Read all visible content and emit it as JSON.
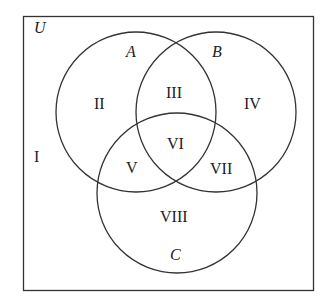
{
  "diagram": {
    "type": "venn-3-set",
    "universe_label": "U",
    "sets": [
      {
        "label": "A"
      },
      {
        "label": "B"
      },
      {
        "label": "C"
      }
    ],
    "regions": [
      "I",
      "II",
      "III",
      "IV",
      "V",
      "VI",
      "VII",
      "VIII"
    ],
    "colors": {
      "stroke": "#333333",
      "background": "#ffffff",
      "text": "#222222"
    }
  }
}
